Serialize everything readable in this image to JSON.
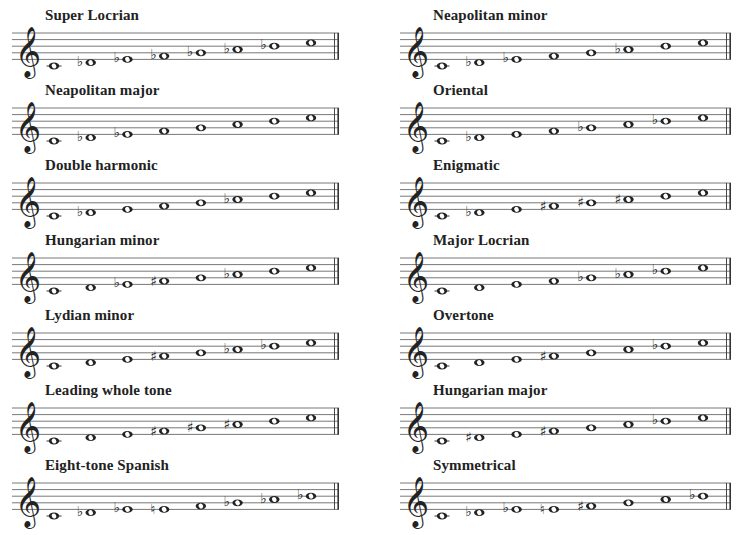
{
  "layout": {
    "columns": [
      {
        "x": 12,
        "staff_width": 327
      },
      {
        "x": 400,
        "staff_width": 331
      }
    ],
    "rows_top_line_y": [
      33,
      108,
      183,
      258,
      333,
      408,
      483
    ],
    "line_spacing": 6.6,
    "ink_color": "#222222"
  },
  "clef": "treble",
  "scales": [
    {
      "name": "Super Locrian",
      "column": 0,
      "row": 0,
      "notes": [
        {
          "step": 0,
          "acc": ""
        },
        {
          "step": 1,
          "acc": "flat"
        },
        {
          "step": 2,
          "acc": "flat"
        },
        {
          "step": 3,
          "acc": "flat"
        },
        {
          "step": 4,
          "acc": "flat"
        },
        {
          "step": 5,
          "acc": "flat"
        },
        {
          "step": 6,
          "acc": "flat"
        },
        {
          "step": 7,
          "acc": ""
        }
      ],
      "note_labels": [
        "C",
        "D♭",
        "E♭",
        "F♭",
        "G♭",
        "A♭",
        "B♭",
        "C"
      ]
    },
    {
      "name": "Neapolitan minor",
      "column": 1,
      "row": 0,
      "notes": [
        {
          "step": 0,
          "acc": ""
        },
        {
          "step": 1,
          "acc": "flat"
        },
        {
          "step": 2,
          "acc": "flat"
        },
        {
          "step": 3,
          "acc": ""
        },
        {
          "step": 4,
          "acc": ""
        },
        {
          "step": 5,
          "acc": "flat"
        },
        {
          "step": 6,
          "acc": ""
        },
        {
          "step": 7,
          "acc": ""
        }
      ],
      "note_labels": [
        "C",
        "D♭",
        "E♭",
        "F",
        "G",
        "A♭",
        "B",
        "C"
      ]
    },
    {
      "name": "Neapolitan major",
      "column": 0,
      "row": 1,
      "notes": [
        {
          "step": 0,
          "acc": ""
        },
        {
          "step": 1,
          "acc": "flat"
        },
        {
          "step": 2,
          "acc": "flat"
        },
        {
          "step": 3,
          "acc": ""
        },
        {
          "step": 4,
          "acc": ""
        },
        {
          "step": 5,
          "acc": ""
        },
        {
          "step": 6,
          "acc": ""
        },
        {
          "step": 7,
          "acc": ""
        }
      ],
      "note_labels": [
        "C",
        "D♭",
        "E♭",
        "F",
        "G",
        "A",
        "B",
        "C"
      ]
    },
    {
      "name": "Oriental",
      "column": 1,
      "row": 1,
      "notes": [
        {
          "step": 0,
          "acc": ""
        },
        {
          "step": 1,
          "acc": "flat"
        },
        {
          "step": 2,
          "acc": ""
        },
        {
          "step": 3,
          "acc": ""
        },
        {
          "step": 4,
          "acc": "flat"
        },
        {
          "step": 5,
          "acc": ""
        },
        {
          "step": 6,
          "acc": "flat"
        },
        {
          "step": 7,
          "acc": ""
        }
      ],
      "note_labels": [
        "C",
        "D♭",
        "E",
        "F",
        "G♭",
        "A",
        "B♭",
        "C"
      ]
    },
    {
      "name": "Double harmonic",
      "column": 0,
      "row": 2,
      "notes": [
        {
          "step": 0,
          "acc": ""
        },
        {
          "step": 1,
          "acc": "flat"
        },
        {
          "step": 2,
          "acc": ""
        },
        {
          "step": 3,
          "acc": ""
        },
        {
          "step": 4,
          "acc": ""
        },
        {
          "step": 5,
          "acc": "flat"
        },
        {
          "step": 6,
          "acc": ""
        },
        {
          "step": 7,
          "acc": ""
        }
      ],
      "note_labels": [
        "C",
        "D♭",
        "E",
        "F",
        "G",
        "A♭",
        "B",
        "C"
      ]
    },
    {
      "name": "Enigmatic",
      "column": 1,
      "row": 2,
      "notes": [
        {
          "step": 0,
          "acc": ""
        },
        {
          "step": 1,
          "acc": "flat"
        },
        {
          "step": 2,
          "acc": ""
        },
        {
          "step": 3,
          "acc": "sharp"
        },
        {
          "step": 4,
          "acc": "sharp"
        },
        {
          "step": 5,
          "acc": "sharp"
        },
        {
          "step": 6,
          "acc": ""
        },
        {
          "step": 7,
          "acc": ""
        }
      ],
      "note_labels": [
        "C",
        "D♭",
        "E",
        "F♯",
        "G♯",
        "A♯",
        "B",
        "C"
      ]
    },
    {
      "name": "Hungarian minor",
      "column": 0,
      "row": 3,
      "notes": [
        {
          "step": 0,
          "acc": ""
        },
        {
          "step": 1,
          "acc": ""
        },
        {
          "step": 2,
          "acc": "flat"
        },
        {
          "step": 3,
          "acc": "sharp"
        },
        {
          "step": 4,
          "acc": ""
        },
        {
          "step": 5,
          "acc": "flat"
        },
        {
          "step": 6,
          "acc": ""
        },
        {
          "step": 7,
          "acc": ""
        }
      ],
      "note_labels": [
        "C",
        "D",
        "E♭",
        "F♯",
        "G",
        "A♭",
        "B",
        "C"
      ]
    },
    {
      "name": "Major Locrian",
      "column": 1,
      "row": 3,
      "notes": [
        {
          "step": 0,
          "acc": ""
        },
        {
          "step": 1,
          "acc": ""
        },
        {
          "step": 2,
          "acc": ""
        },
        {
          "step": 3,
          "acc": ""
        },
        {
          "step": 4,
          "acc": "flat"
        },
        {
          "step": 5,
          "acc": "flat"
        },
        {
          "step": 6,
          "acc": "flat"
        },
        {
          "step": 7,
          "acc": ""
        }
      ],
      "note_labels": [
        "C",
        "D",
        "E",
        "F",
        "G♭",
        "A♭",
        "B♭",
        "C"
      ]
    },
    {
      "name": "Lydian minor",
      "column": 0,
      "row": 4,
      "notes": [
        {
          "step": 0,
          "acc": ""
        },
        {
          "step": 1,
          "acc": ""
        },
        {
          "step": 2,
          "acc": ""
        },
        {
          "step": 3,
          "acc": "sharp"
        },
        {
          "step": 4,
          "acc": ""
        },
        {
          "step": 5,
          "acc": "flat"
        },
        {
          "step": 6,
          "acc": "flat"
        },
        {
          "step": 7,
          "acc": ""
        }
      ],
      "note_labels": [
        "C",
        "D",
        "E",
        "F♯",
        "G",
        "A♭",
        "B♭",
        "C"
      ]
    },
    {
      "name": "Overtone",
      "column": 1,
      "row": 4,
      "notes": [
        {
          "step": 0,
          "acc": ""
        },
        {
          "step": 1,
          "acc": ""
        },
        {
          "step": 2,
          "acc": ""
        },
        {
          "step": 3,
          "acc": "sharp"
        },
        {
          "step": 4,
          "acc": ""
        },
        {
          "step": 5,
          "acc": ""
        },
        {
          "step": 6,
          "acc": "flat"
        },
        {
          "step": 7,
          "acc": ""
        }
      ],
      "note_labels": [
        "C",
        "D",
        "E",
        "F♯",
        "G",
        "A",
        "B♭",
        "C"
      ]
    },
    {
      "name": "Leading whole tone",
      "column": 0,
      "row": 5,
      "notes": [
        {
          "step": 0,
          "acc": ""
        },
        {
          "step": 1,
          "acc": ""
        },
        {
          "step": 2,
          "acc": ""
        },
        {
          "step": 3,
          "acc": "sharp"
        },
        {
          "step": 4,
          "acc": "sharp"
        },
        {
          "step": 5,
          "acc": "sharp"
        },
        {
          "step": 6,
          "acc": ""
        },
        {
          "step": 7,
          "acc": ""
        }
      ],
      "note_labels": [
        "C",
        "D",
        "E",
        "F♯",
        "G♯",
        "A♯",
        "B",
        "C"
      ]
    },
    {
      "name": "Hungarian major",
      "column": 1,
      "row": 5,
      "notes": [
        {
          "step": 0,
          "acc": ""
        },
        {
          "step": 1,
          "acc": "sharp"
        },
        {
          "step": 2,
          "acc": ""
        },
        {
          "step": 3,
          "acc": "sharp"
        },
        {
          "step": 4,
          "acc": ""
        },
        {
          "step": 5,
          "acc": ""
        },
        {
          "step": 6,
          "acc": "flat"
        },
        {
          "step": 7,
          "acc": ""
        }
      ],
      "note_labels": [
        "C",
        "D♯",
        "E",
        "F♯",
        "G",
        "A",
        "B♭",
        "C"
      ]
    },
    {
      "name": "Eight-tone Spanish",
      "column": 0,
      "row": 6,
      "notes": [
        {
          "step": 0,
          "acc": ""
        },
        {
          "step": 1,
          "acc": "flat"
        },
        {
          "step": 2,
          "acc": "flat"
        },
        {
          "step": 2,
          "acc": "natural"
        },
        {
          "step": 3,
          "acc": ""
        },
        {
          "step": 4,
          "acc": "flat"
        },
        {
          "step": 5,
          "acc": "flat"
        },
        {
          "step": 6,
          "acc": "flat"
        }
      ],
      "note_labels": [
        "C",
        "D♭",
        "E♭",
        "E♮",
        "F",
        "G♭",
        "A♭",
        "B♭"
      ]
    },
    {
      "name": "Symmetrical",
      "column": 1,
      "row": 6,
      "notes": [
        {
          "step": 0,
          "acc": ""
        },
        {
          "step": 1,
          "acc": "flat"
        },
        {
          "step": 2,
          "acc": "flat"
        },
        {
          "step": 2,
          "acc": "natural"
        },
        {
          "step": 3,
          "acc": "sharp"
        },
        {
          "step": 4,
          "acc": ""
        },
        {
          "step": 5,
          "acc": ""
        },
        {
          "step": 6,
          "acc": "flat"
        }
      ],
      "note_labels": [
        "C",
        "D♭",
        "E♭",
        "E♮",
        "F♯",
        "G",
        "A",
        "B♭"
      ]
    }
  ]
}
